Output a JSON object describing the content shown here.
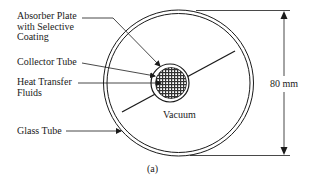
{
  "diagram": {
    "caption": "(a)",
    "labels": {
      "absorber_line1": "Absorber Plate",
      "absorber_line2": "with Selective",
      "absorber_line3": "Coating",
      "collector_tube": "Collector Tube",
      "heat_transfer_line1": "Heat Transfer",
      "heat_transfer_line2": "Fluids",
      "glass_tube": "Glass Tube",
      "vacuum": "Vacuum",
      "dimension": "80 mm"
    },
    "colors": {
      "ink": "#1a1a1a",
      "background": "#ffffff"
    },
    "components": [
      "Absorber Plate with Selective Coating",
      "Collector Tube",
      "Heat Transfer Fluids",
      "Glass Tube",
      "Vacuum"
    ],
    "dimension_value": "80 mm"
  }
}
